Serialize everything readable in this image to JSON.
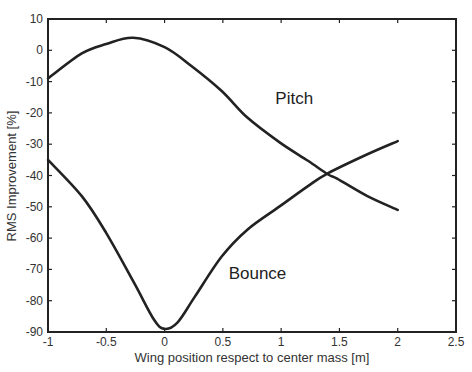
{
  "chart_data": {
    "type": "line",
    "title": "",
    "xlabel": "Wing position respect to center mass [m]",
    "ylabel": "RMS Improvement [%]",
    "xlim": [
      -1,
      2.5
    ],
    "ylim": [
      -90,
      10
    ],
    "xticks": [
      -1,
      -0.5,
      0,
      0.5,
      1,
      1.5,
      2,
      2.5
    ],
    "xtick_labels": [
      "-1",
      "-0.5",
      "0",
      "0.5",
      "1",
      "1.5",
      "2",
      "2.5"
    ],
    "yticks": [
      10,
      0,
      -10,
      -20,
      -30,
      -40,
      -50,
      -60,
      -70,
      -80,
      -90
    ],
    "ytick_labels": [
      "10",
      "0",
      "-10",
      "-20",
      "-30",
      "-40",
      "-50",
      "-60",
      "-70",
      "-80",
      "-90"
    ],
    "grid": false,
    "legend": "none (inline labels)",
    "series": [
      {
        "name": "Pitch",
        "label_pos": [
          0.95,
          -17
        ],
        "x": [
          -1,
          -0.71,
          -0.5,
          -0.27,
          0,
          0.23,
          0.49,
          0.71,
          0.99,
          1.23,
          1.4,
          1.48,
          1.74,
          2.0
        ],
        "values": [
          -9,
          -1,
          2,
          4,
          1,
          -5,
          -13,
          -21.5,
          -29.5,
          -35.3,
          -39.6,
          -41,
          -46.6,
          -51
        ]
      },
      {
        "name": "Bounce",
        "label_pos": [
          0.55,
          -73
        ],
        "x": [
          -1,
          -0.71,
          -0.5,
          -0.26,
          -0.09,
          0,
          0.11,
          0.26,
          0.49,
          0.71,
          0.99,
          1.23,
          1.4,
          1.74,
          2.0
        ],
        "values": [
          -35,
          -46.6,
          -58.4,
          -74.4,
          -86.1,
          -89,
          -87,
          -78.7,
          -65.9,
          -57.3,
          -49.8,
          -43.4,
          -39.3,
          -33.2,
          -29
        ]
      }
    ],
    "annotations": [
      "Pitch",
      "Bounce"
    ]
  },
  "colors": {
    "line": "#222222",
    "axis": "#222222",
    "background": "#ffffff"
  }
}
